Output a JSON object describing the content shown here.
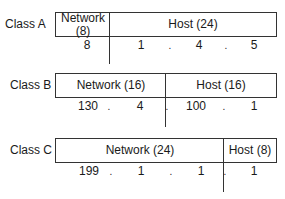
{
  "classes": [
    {
      "name": "Class A",
      "network_label": "Network (8)",
      "network_line1": "Network",
      "network_line2": "(8)",
      "host_label": "Host (24)",
      "octets": [
        "8",
        "1",
        "4",
        "5"
      ]
    },
    {
      "name": "Class B",
      "network_label": "Network (16)",
      "host_label": "Host (16)",
      "octets": [
        "130",
        "4",
        "100",
        "1"
      ]
    },
    {
      "name": "Class C",
      "network_label": "Network (24)",
      "host_label": "Host (8)",
      "octets": [
        "199",
        "1",
        "1",
        "1"
      ]
    }
  ],
  "separator": "."
}
